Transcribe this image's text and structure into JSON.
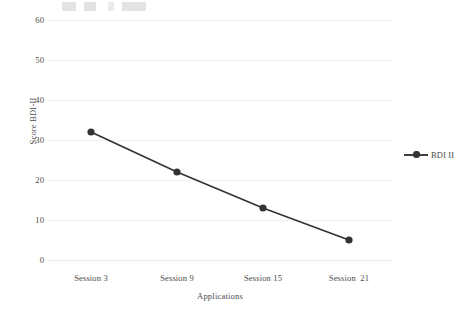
{
  "chart_data": {
    "type": "line",
    "title": "",
    "subtitle": "",
    "xlabel": "Applications",
    "ylabel": "Score BDI-II",
    "categories": [
      "Session 3",
      "Session 9",
      "Session 15",
      "Session  21"
    ],
    "series": [
      {
        "name": "BDI II",
        "values": [
          32,
          22,
          13,
          5
        ],
        "color": "#333333",
        "marker": "circle"
      }
    ],
    "ylim": [
      0,
      60
    ],
    "yticks": [
      0,
      10,
      20,
      30,
      40,
      50,
      60
    ],
    "ytick_labels": [
      "0",
      "10",
      "20",
      "30",
      "40",
      "50",
      "60"
    ],
    "grid": "horizontal",
    "grid_color": "#f0f0f1",
    "legend_position": "right",
    "legend_entries": [
      "BDI II"
    ],
    "annotations": []
  },
  "legend": {
    "items": [
      {
        "label": "BDI II",
        "symbol": "line-marker"
      }
    ]
  }
}
